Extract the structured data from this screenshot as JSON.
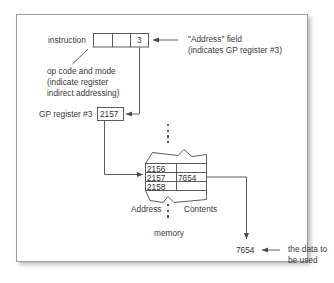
{
  "figure": {
    "frame_color": "#9d9d9d",
    "text_color": "#3a3a3a",
    "line_color": "#4a4a4a"
  },
  "instruction": {
    "label": "instruction",
    "fields": [
      "",
      "",
      "3"
    ],
    "address_field_value": "3"
  },
  "annotations": {
    "address_field_line1": "\"Address\" field",
    "address_field_line2": "(indicates GP register #3)",
    "opcode_line1": "op code and mode",
    "opcode_line2": "(indicate register",
    "opcode_line3": "indirect addressing)"
  },
  "register": {
    "label": "GP register #3",
    "value": "2157"
  },
  "memory": {
    "caption": "memory",
    "address_header": "Address",
    "contents_header": "Contents",
    "rows": [
      {
        "address": "2156",
        "contents": ""
      },
      {
        "address": "2157",
        "contents": "7654"
      },
      {
        "address": "2158",
        "contents": ""
      }
    ]
  },
  "result": {
    "value": "7654",
    "note_line1": "the data to",
    "note_line2": "be used"
  }
}
